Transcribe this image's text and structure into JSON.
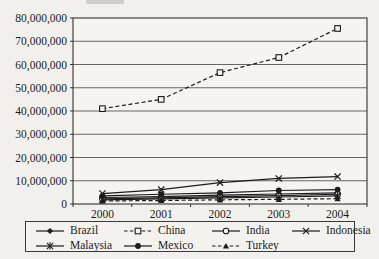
{
  "figure": {
    "background": "#f2f0ec",
    "ink_color": "#1c1c1c",
    "grid_color": "#565656",
    "axis_color": "#333333"
  },
  "chart_data": {
    "type": "line",
    "categories": [
      "2000",
      "2001",
      "2002",
      "2003",
      "2004"
    ],
    "series": [
      {
        "name": "Brazil",
        "marker": "diamond-filled-icon",
        "line_style": "solid",
        "color": "#1c1c1c",
        "values": [
          2800000,
          3200000,
          3800000,
          4300000,
          4800000
        ]
      },
      {
        "name": "China",
        "marker": "square-open-icon",
        "line_style": "dashed",
        "color": "#1c1c1c",
        "values": [
          41000000,
          45000000,
          56500000,
          63000000,
          75500000
        ]
      },
      {
        "name": "India",
        "marker": "circle-open-icon",
        "line_style": "solid",
        "color": "#1c1c1c",
        "values": [
          2200000,
          2600000,
          3200000,
          3600000,
          4200000
        ]
      },
      {
        "name": "Indonesia",
        "marker": "x-icon",
        "line_style": "solid",
        "color": "#1c1c1c",
        "values": [
          4500000,
          6200000,
          9200000,
          11000000,
          11800000
        ]
      },
      {
        "name": "Malaysia",
        "marker": "asterisk-icon",
        "line_style": "solid",
        "color": "#1c1c1c",
        "values": [
          1800000,
          2200000,
          2600000,
          3000000,
          3500000
        ]
      },
      {
        "name": "Mexico",
        "marker": "circle-filled-icon",
        "line_style": "solid",
        "color": "#1c1c1c",
        "values": [
          3500000,
          4200000,
          4800000,
          5800000,
          6200000
        ]
      },
      {
        "name": "Turkey",
        "marker": "triangle-filled-icon",
        "line_style": "dashed",
        "color": "#1c1c1c",
        "values": [
          1300000,
          1500000,
          1800000,
          2000000,
          2300000
        ]
      }
    ],
    "ylim": [
      0,
      80000000
    ],
    "ytick_step": 10000000,
    "ytick_labels": [
      "0",
      "10,000,000",
      "20,000,000",
      "30,000,000",
      "40,000,000",
      "50,000,000",
      "60,000,000",
      "70,000,000",
      "80,000,000"
    ],
    "grid": "horizontal",
    "legend_position": "bottom",
    "legend_order": [
      "Brazil",
      "China",
      "India",
      "Indonesia",
      "Malaysia",
      "Mexico",
      "Turkey"
    ]
  }
}
